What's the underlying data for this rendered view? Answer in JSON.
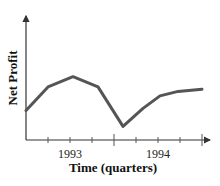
{
  "chart_data": {
    "type": "line",
    "title": "",
    "xlabel": "Time (quarters)",
    "ylabel": "Net Profit",
    "x_tick_labels": [
      "1993",
      "1994"
    ],
    "x": [
      "Q4 1992",
      "Q1 1993",
      "Q2 1993",
      "Q3 1993",
      "Q4 1993",
      "Q1 1994",
      "Q2 1994",
      "Q3 1994",
      "Q4 1994"
    ],
    "series": [
      {
        "name": "Net Profit",
        "values": [
          2.6,
          4.7,
          5.6,
          4.7,
          1.2,
          2.8,
          3.9,
          4.3,
          4.5
        ]
      }
    ],
    "yticks": [],
    "grid": false,
    "legend": "none"
  },
  "colors": {
    "line": "#555555",
    "axis": "#333333"
  }
}
